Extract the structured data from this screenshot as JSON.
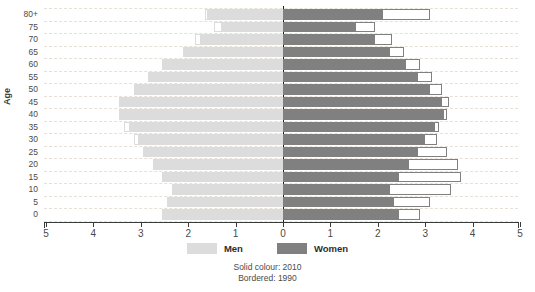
{
  "chart_data": {
    "type": "bar",
    "subtype": "population-pyramid",
    "title": "",
    "xlabel": "",
    "ylabel": "Age",
    "categories": [
      "0",
      "5",
      "10",
      "15",
      "20",
      "25",
      "30",
      "35",
      "40",
      "45",
      "50",
      "55",
      "60",
      "65",
      "70",
      "75",
      "80+"
    ],
    "x_ticks": [
      "5",
      "4",
      "3",
      "2",
      "1",
      "0",
      "1",
      "2",
      "3",
      "4",
      "5"
    ],
    "x_tick_values": [
      -5,
      -4,
      -3,
      -2,
      -1,
      0,
      1,
      2,
      3,
      4,
      5
    ],
    "xlim": [
      -5,
      5
    ],
    "grid": true,
    "grid_style": "dashed horizontal",
    "legend": [
      {
        "name": "Men",
        "color": "#dcdcdc"
      },
      {
        "name": "Women",
        "color": "#808080"
      }
    ],
    "legend_position": "bottom-center",
    "annotations": [
      "Solid colour: 2010",
      "Bordered: 1990"
    ],
    "series": [
      {
        "name": "Men 2010",
        "style": "solid",
        "color": "#dcdcdc",
        "side": "left",
        "values": [
          2.55,
          2.45,
          2.35,
          2.55,
          2.75,
          2.95,
          3.05,
          3.25,
          3.45,
          3.45,
          3.15,
          2.85,
          2.55,
          2.1,
          1.75,
          1.3,
          1.6
        ]
      },
      {
        "name": "Men 1990",
        "style": "bordered",
        "color": "#dcdcdc",
        "side": "left",
        "values": [
          2.55,
          2.45,
          2.35,
          2.55,
          2.75,
          2.95,
          3.15,
          3.35,
          3.45,
          3.25,
          3.0,
          2.75,
          2.45,
          2.1,
          1.85,
          1.45,
          1.65
        ]
      },
      {
        "name": "Women 2010",
        "style": "solid",
        "color": "#808080",
        "side": "right",
        "values": [
          2.45,
          2.35,
          2.25,
          2.45,
          2.65,
          2.85,
          3.0,
          3.2,
          3.4,
          3.35,
          3.1,
          2.85,
          2.6,
          2.25,
          1.95,
          1.55,
          2.1
        ]
      },
      {
        "name": "Women 1990",
        "style": "bordered",
        "color": "#808080",
        "side": "right",
        "values": [
          2.9,
          3.1,
          3.55,
          3.75,
          3.7,
          3.45,
          3.25,
          3.3,
          3.45,
          3.5,
          3.35,
          3.15,
          2.9,
          2.55,
          2.3,
          1.95,
          3.1
        ]
      }
    ]
  },
  "legend": {
    "men_label": "Men",
    "women_label": "Women"
  },
  "caption": {
    "line1": "Solid colour: 2010",
    "line2": "Bordered: 1990"
  },
  "axis": {
    "y_title": "Age"
  }
}
